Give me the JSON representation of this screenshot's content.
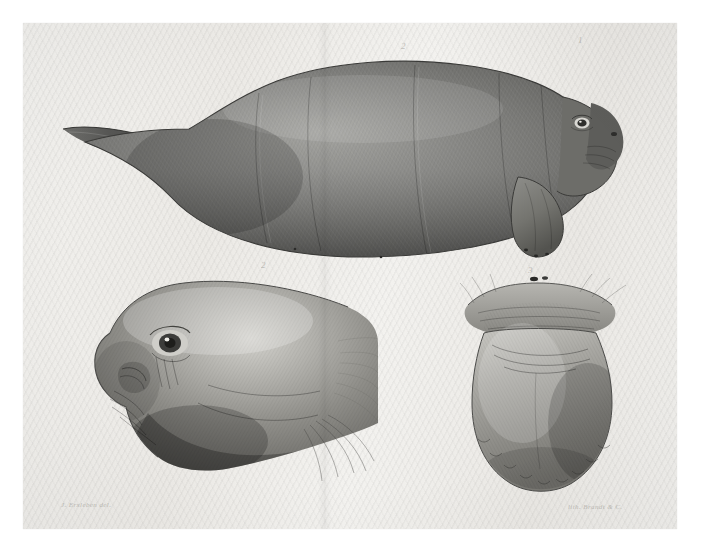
{
  "plate": {
    "domain_kind": "natural-history-lithograph",
    "subject": "dugong",
    "medium_note": "tinted lithograph on aged wove paper",
    "paper_color": "#efeeea",
    "ink_color": "#4a4a48",
    "border_color": "#ffffff",
    "fold_present": "vertical centre fold"
  },
  "annotations": {
    "fig1_number": "2",
    "fig1_number_right": "1",
    "fig2_number": "2",
    "fig3_number": "3",
    "signature_left": "J. Erxleben del.",
    "signature_right": "lith. Brandt & C.",
    "fig1_body_mark": "1",
    "fig1_belly_mark": "4"
  },
  "figures": [
    {
      "id": "fig-1",
      "name": "dugong-whole-body-lateral",
      "caption": "Fig. 1 — entire animal, lateral view, head to right",
      "parts": [
        "tail-fluke",
        "body",
        "head",
        "muzzle",
        "eye",
        "pectoral-flipper"
      ]
    },
    {
      "id": "fig-2",
      "name": "dugong-head-profile",
      "caption": "Fig. 2 — head in profile, enlarged",
      "parts": [
        "cranium",
        "eye",
        "nostril",
        "upper-lip-disc",
        "bristles"
      ]
    },
    {
      "id": "fig-3",
      "name": "dugong-muzzle-frontal",
      "caption": "Fig. 3 — muzzle seen from in front / below",
      "parts": [
        "nostrils",
        "upper-lip-pad",
        "lip-disc",
        "bristle-fringe"
      ]
    }
  ],
  "colors": {
    "body_dark": "#5a5a58",
    "body_mid": "#7c7c79",
    "body_light": "#a6a6a2",
    "highlight": "#d8d7d2",
    "outline": "#3c3c3a"
  }
}
